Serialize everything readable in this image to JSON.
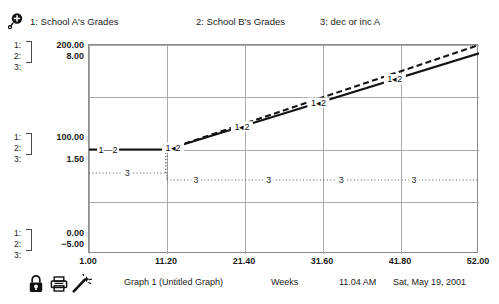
{
  "window": {
    "title": "Graph 1 (Untitled Graph)"
  },
  "legend": {
    "glyph_icon": "lollipop-magnifier-icon",
    "entries": [
      {
        "index": "1",
        "label": "1: School A's Grades"
      },
      {
        "index": "2",
        "label": "2: School B's Grades"
      },
      {
        "index": "3",
        "label": "3: dec or inc A"
      }
    ]
  },
  "y_axis_groups": [
    {
      "position": "top",
      "rows": [
        {
          "index": "1:",
          "value": "200.00"
        },
        {
          "index": "2:",
          "value": "8.00"
        },
        {
          "index": "3:",
          "value": ""
        }
      ]
    },
    {
      "position": "middle",
      "rows": [
        {
          "index": "1:",
          "value": "100.00"
        },
        {
          "index": "2:",
          "value": ""
        },
        {
          "index": "3:",
          "value": "1.50"
        }
      ]
    },
    {
      "position": "bottom",
      "rows": [
        {
          "index": "1:",
          "value": "0.00"
        },
        {
          "index": "2:",
          "value": "−5.00"
        },
        {
          "index": "3:",
          "value": ""
        }
      ]
    }
  ],
  "x_ticks": [
    {
      "label": "1.00",
      "x": 88
    },
    {
      "label": "11.20",
      "x": 166
    },
    {
      "label": "21.40",
      "x": 244
    },
    {
      "label": "31.60",
      "x": 322
    },
    {
      "label": "41.80",
      "x": 400
    },
    {
      "label": "52.00",
      "x": 478
    }
  ],
  "statusbar": {
    "graph_name": "Graph 1 (Untitled Graph)",
    "x_axis_name": "Weeks",
    "time": "11.04 AM",
    "date": "Sat, May 19, 2001",
    "icons": [
      {
        "name": "lock-icon",
        "title": "Lock"
      },
      {
        "name": "printer-icon",
        "title": "Print"
      },
      {
        "name": "wand-icon",
        "title": "Magic Wand"
      }
    ]
  },
  "colors": {
    "frame": "#8d8d8d",
    "grid": "#a9a9a9",
    "series_1": "#141414",
    "series_2": "#141414",
    "series_3": "#565656",
    "background": "#ffffff"
  },
  "chart_data": {
    "type": "line",
    "title": "Graph 1 (Untitled Graph)",
    "xlabel": "Weeks",
    "ylabel": "",
    "grid": true,
    "legend_position": "top",
    "xlim": [
      1.0,
      52.0
    ],
    "xticks": [
      1.0,
      11.2,
      21.4,
      31.6,
      41.8,
      52.0
    ],
    "axes": [
      {
        "id": 1,
        "name": "School A's Grades",
        "ylim": [
          0.0,
          200.0
        ],
        "yticks": [
          0.0,
          100.0,
          200.0
        ]
      },
      {
        "id": 2,
        "name": "School B's Grades",
        "ylim": [
          -5.0,
          8.0
        ],
        "yticks": [
          -5.0,
          8.0
        ]
      },
      {
        "id": 3,
        "name": "dec or inc A",
        "ylim": [
          null,
          null
        ],
        "yticks": [
          1.5
        ]
      }
    ],
    "series": [
      {
        "name": "School A's Grades",
        "marker_label": "1",
        "axis": 1,
        "style": "solid",
        "color": "#141414",
        "x": [
          1.0,
          11.2,
          52.0
        ],
        "y": [
          100.0,
          100.0,
          192.0
        ]
      },
      {
        "name": "School B's Grades",
        "marker_label": "2",
        "axis": 2,
        "style": "dashed",
        "color": "#141414",
        "x": [
          11.2,
          52.0
        ],
        "y": [
          1.5,
          8.0
        ]
      },
      {
        "name": "dec or inc A",
        "marker_label": "3",
        "axis": 3,
        "style": "dotted",
        "color": "#565656",
        "x": [
          1.0,
          11.2,
          11.2,
          52.0
        ],
        "y": [
          1.5,
          1.5,
          1.42,
          1.42
        ]
      }
    ],
    "point_labels": [
      {
        "series": "1-2",
        "x": 3.5,
        "label": "1—2"
      },
      {
        "series": "1-2",
        "x": 12.0,
        "label": "1◂2"
      },
      {
        "series": "1-2",
        "x": 21.0,
        "label": "1◂2"
      },
      {
        "series": "1-2",
        "x": 31.0,
        "label": "1◂2"
      },
      {
        "series": "1-2",
        "x": 41.0,
        "label": "1◂2"
      },
      {
        "series": "3",
        "x": 6.0,
        "label": "3"
      },
      {
        "series": "3",
        "x": 15.0,
        "label": "3"
      },
      {
        "series": "3",
        "x": 24.5,
        "label": "3"
      },
      {
        "series": "3",
        "x": 34.0,
        "label": "3"
      },
      {
        "series": "3",
        "x": 43.5,
        "label": "3"
      }
    ]
  }
}
